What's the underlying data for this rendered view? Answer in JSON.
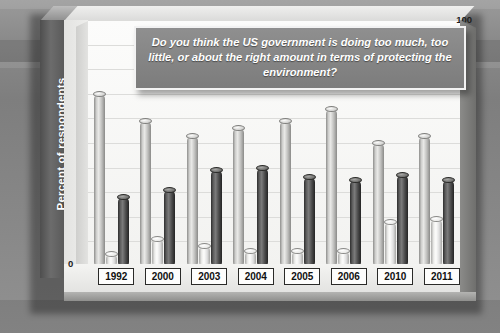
{
  "chart_data": {
    "type": "bar",
    "title": "Do you think the US government is doing too much, too little, or about the right amount in terms of protecting the environment?",
    "xlabel": "",
    "ylabel": "Percent of respondents",
    "ylim": [
      0,
      100
    ],
    "ytick_step": 10,
    "yticks": [
      100,
      90,
      80,
      70,
      60,
      50,
      40,
      30,
      20,
      10,
      0
    ],
    "grid": true,
    "legend": "none",
    "categories": [
      "1992",
      "2000",
      "2003",
      "2004",
      "2005",
      "2006",
      "2010",
      "2011"
    ],
    "series": [
      {
        "name": "Too little",
        "style": "light",
        "values": [
          70,
          59,
          53,
          56,
          59,
          64,
          50,
          53
        ]
      },
      {
        "name": "Too much",
        "style": "white",
        "values": [
          5,
          11,
          8,
          6,
          6,
          6,
          18,
          19
        ]
      },
      {
        "name": "About right",
        "style": "dark",
        "values": [
          28,
          31,
          39,
          40,
          36,
          35,
          37,
          35
        ]
      }
    ]
  },
  "chart": {
    "axis_title": "Percent of respondents",
    "title_text": "Do you think the US government is doing too much, too little, or about the right amount in terms of protecting the environment?",
    "zero_label": "0"
  },
  "colors": {
    "background": "#8a8a8a",
    "plot_area": "#fcfcfb",
    "title_box": "#858585",
    "bar_light": "#cfcfcd",
    "bar_white": "#fdfdfc",
    "bar_dark": "#3a3a3a",
    "axis_text": "#1d1d1d",
    "axis_panel": "#5a5a5a"
  }
}
